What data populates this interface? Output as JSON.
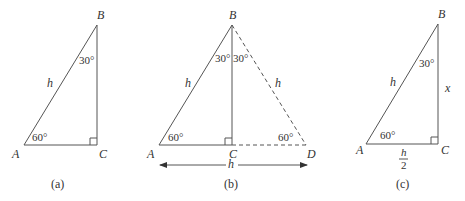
{
  "figures": [
    {
      "id": "a",
      "caption": "(a)",
      "vertices": {
        "A": "A",
        "B": "B",
        "C": "C"
      },
      "hypotenuse_label": "h",
      "angle_A": "60°",
      "angle_B": "30°",
      "right_angle_at": "C"
    },
    {
      "id": "b",
      "caption": "(b)",
      "vertices": {
        "A": "A",
        "B": "B",
        "C": "C",
        "D": "D"
      },
      "side_AB_label": "h",
      "side_BD_label": "h",
      "angle_A": "60°",
      "angle_D": "60°",
      "angle_B_left": "30°",
      "angle_B_right": "30°",
      "base_arrow_label": "h",
      "right_angle_at": "C"
    },
    {
      "id": "c",
      "caption": "(c)",
      "vertices": {
        "A": "A",
        "B": "B",
        "C": "C"
      },
      "hypotenuse_label": "h",
      "side_BC_label": "x",
      "side_AC_numerator": "h",
      "side_AC_denominator": "2",
      "angle_A": "60°",
      "angle_B": "30°",
      "right_angle_at": "C"
    }
  ],
  "colors": {
    "line": "#555555",
    "text": "#333333",
    "background": "#ffffff"
  }
}
